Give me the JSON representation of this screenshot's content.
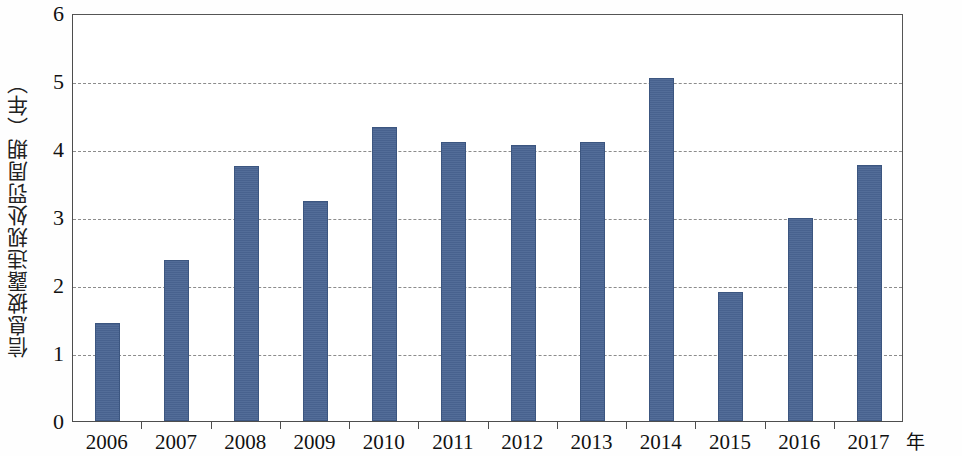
{
  "chart_data": {
    "type": "bar",
    "title": "",
    "subtitle": "",
    "xlabel": "年",
    "ylabel": "信息披露违规处罚周期（年）",
    "categories": [
      "2006",
      "2007",
      "2008",
      "2009",
      "2010",
      "2011",
      "2012",
      "2013",
      "2014",
      "2015",
      "2016",
      "2017"
    ],
    "values": [
      1.44,
      2.37,
      3.75,
      3.24,
      4.32,
      4.11,
      4.06,
      4.1,
      5.04,
      1.89,
      2.99,
      3.76
    ],
    "series": [
      {
        "name": "信息披露违规处罚周期（年）",
        "values": [
          1.44,
          2.37,
          3.75,
          3.24,
          4.32,
          4.11,
          4.06,
          4.1,
          5.04,
          1.89,
          2.99,
          3.76
        ]
      }
    ],
    "ylim": [
      0,
      6
    ],
    "ytick_labels": [
      "0",
      "1",
      "2",
      "3",
      "4",
      "5",
      "6"
    ],
    "ytick_values": [
      0,
      1,
      2,
      3,
      4,
      5,
      6
    ],
    "grid": "horizontal-dashed",
    "gridline_values": [
      1,
      2,
      3,
      4,
      5
    ],
    "legend": "none",
    "legend_position": "",
    "annotations": [],
    "colors": {
      "bar": "#4a6593",
      "bar_border": "#3c5680",
      "gridline": "#8c8c8c",
      "axis": "#4d4d4d",
      "text": "#111111",
      "background": "#ffffff"
    }
  }
}
